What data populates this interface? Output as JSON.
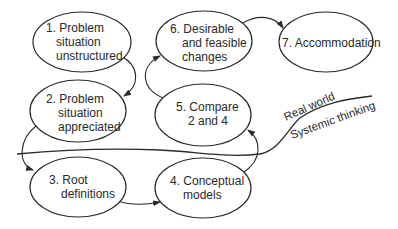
{
  "diagram": {
    "colors": {
      "stroke": "#2a2a2a",
      "background": "#ffffff",
      "text": "#2a2a2a"
    },
    "nodes": [
      {
        "id": "1",
        "lines": [
          "1. Problem",
          "situation",
          "unstructured"
        ]
      },
      {
        "id": "2",
        "lines": [
          "2. Problem",
          "situation",
          "appreciated"
        ]
      },
      {
        "id": "3",
        "lines": [
          "3. Root",
          "definitions"
        ]
      },
      {
        "id": "4",
        "lines": [
          "4. Conceptual",
          "models"
        ]
      },
      {
        "id": "5",
        "lines": [
          "5. Compare",
          "2 and 4"
        ]
      },
      {
        "id": "6",
        "lines": [
          "6. Desirable",
          "and feasible",
          "changes"
        ]
      },
      {
        "id": "7",
        "lines": [
          "7. Accommodation"
        ]
      }
    ],
    "edges": [
      {
        "from": "1",
        "to": "2"
      },
      {
        "from": "2",
        "to": "3"
      },
      {
        "from": "3",
        "to": "4"
      },
      {
        "from": "4",
        "to": "5"
      },
      {
        "from": "5",
        "to": "6"
      },
      {
        "from": "6",
        "to": "7"
      }
    ],
    "divider": {
      "upper_label": "Real world",
      "lower_label": "Systemic thinking"
    }
  }
}
